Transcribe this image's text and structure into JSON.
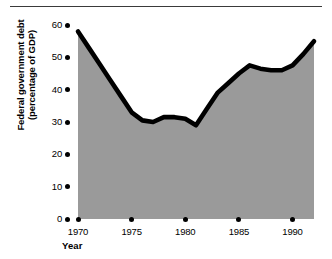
{
  "chart_data": {
    "type": "area",
    "title": "",
    "xlabel": "Year",
    "ylabel": "Federal government debt (percentage of GDP)",
    "ylabel_line1": "Federal government debt",
    "ylabel_line2": "(percentage of GDP)",
    "xlim": [
      1970,
      1992
    ],
    "ylim": [
      0,
      60
    ],
    "grid": false,
    "legend": null,
    "fill_color": "#9a9a9a",
    "line_color": "#000000",
    "background_color": "#ffffff",
    "y_ticks": [
      60,
      50,
      40,
      30,
      20,
      10,
      0
    ],
    "y_tick_labels": [
      "60",
      "50",
      "40",
      "30",
      "20",
      "10",
      "0"
    ],
    "x_ticks": [
      1970,
      1975,
      1980,
      1985,
      1990
    ],
    "x_tick_labels": [
      "1970",
      "1975",
      "1980",
      "1985",
      "1990"
    ],
    "x": [
      1970,
      1971,
      1972,
      1973,
      1974,
      1975,
      1976,
      1977,
      1978,
      1979,
      1980,
      1981,
      1982,
      1983,
      1984,
      1985,
      1986,
      1987,
      1988,
      1989,
      1990,
      1991,
      1992
    ],
    "values": [
      58,
      53,
      48,
      43,
      38,
      33,
      30.5,
      30,
      31.5,
      31.5,
      31,
      29,
      34,
      39,
      42,
      45,
      47.5,
      46.5,
      46,
      46,
      47.5,
      51,
      55
    ],
    "series": [
      {
        "name": "Federal government debt (percentage of GDP)",
        "values": [
          58,
          53,
          48,
          43,
          38,
          33,
          30.5,
          30,
          31.5,
          31.5,
          31,
          29,
          34,
          39,
          42,
          45,
          47.5,
          46.5,
          46,
          46,
          47.5,
          51,
          55
        ]
      }
    ]
  }
}
